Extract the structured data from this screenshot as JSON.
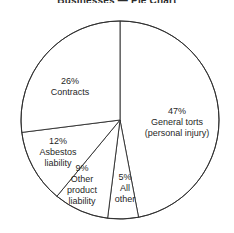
{
  "title": "Businesses — Pie Chart",
  "chart_data": {
    "type": "pie",
    "title": "Businesses — Pie Chart",
    "xlabel": "",
    "ylabel": "",
    "grid": false,
    "legend": "none",
    "labels_inline": true,
    "start_angle_deg": 0,
    "direction": "clockwise",
    "center": [
      120,
      120
    ],
    "radius": 99,
    "categories": [
      "General torts (personal injury)",
      "All other",
      "Other product liability",
      "Asbestos liability",
      "Contracts"
    ],
    "values": [
      47,
      5,
      9,
      12,
      26
    ],
    "units": "percent",
    "slices": [
      {
        "name": "general-torts",
        "percent_text": "47%",
        "value": 47,
        "line1": "General torts",
        "line2": "(personal injury)",
        "line3": "",
        "start_deg": 0,
        "end_deg": 169.2,
        "fill": "#ffffff",
        "stroke": "#2b2b2b"
      },
      {
        "name": "all-other",
        "percent_text": "5%",
        "value": 5,
        "line1": "All",
        "line2": "other",
        "line3": "",
        "start_deg": 169.2,
        "end_deg": 187.2,
        "fill": "#ffffff",
        "stroke": "#2b2b2b"
      },
      {
        "name": "other-product-liability",
        "percent_text": "9%",
        "value": 9,
        "line1": "Other",
        "line2": "product",
        "line3": "liability",
        "start_deg": 187.2,
        "end_deg": 219.6,
        "fill": "#ffffff",
        "stroke": "#2b2b2b"
      },
      {
        "name": "asbestos-liability",
        "percent_text": "12%",
        "value": 12,
        "line1": "Asbestos",
        "line2": "liability",
        "line3": "",
        "start_deg": 219.6,
        "end_deg": 262.8,
        "fill": "#ffffff",
        "stroke": "#2b2b2b"
      },
      {
        "name": "contracts",
        "percent_text": "26%",
        "value": 26,
        "line1": "Contracts",
        "line2": "",
        "line3": "",
        "start_deg": 262.8,
        "end_deg": 360,
        "fill": "#ffffff",
        "stroke": "#2b2b2b"
      }
    ]
  },
  "colors": {
    "background": "#ffffff",
    "outline": "#2b2b2b",
    "text": "#1f1f1f"
  }
}
